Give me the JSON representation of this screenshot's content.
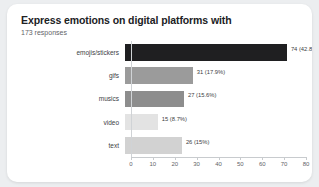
{
  "card": {
    "title": "Express emotions on digital platforms with",
    "subtitle": "173 responses"
  },
  "chart_data": {
    "type": "bar",
    "orientation": "horizontal",
    "title": "Express emotions on digital platforms with",
    "subtitle": "173 responses",
    "xlabel": "",
    "ylabel": "",
    "xlim": [
      0,
      80
    ],
    "grid": false,
    "legend": null,
    "categories": [
      "emojis/stickers",
      "gifs",
      "musics",
      "video",
      "text"
    ],
    "values": [
      74,
      31,
      27,
      15,
      26
    ],
    "percents": [
      "42.8%",
      "17.9%",
      "15.6%",
      "8.7%",
      "15%"
    ],
    "data_labels": [
      "74 (42.8%)",
      "31 (17.9%)",
      "27 (15.6%)",
      "15 (8.7%)",
      "26 (15%)"
    ],
    "bar_colors": [
      "#1f1f21",
      "#9b9b9b",
      "#8d8d8d",
      "#e3e3e3",
      "#d2d2d2"
    ],
    "xticks": [
      "0",
      "10",
      "20",
      "30",
      "40",
      "50",
      "60",
      "70",
      "80"
    ],
    "xtick_values": [
      0,
      10,
      20,
      30,
      40,
      50,
      60,
      70,
      80
    ]
  },
  "colors": {
    "page_background": "#eceef0",
    "card_background": "#ffffff",
    "title_text": "#202124",
    "subtitle_text": "#5f6368",
    "axis_line": "#c8cbce"
  }
}
